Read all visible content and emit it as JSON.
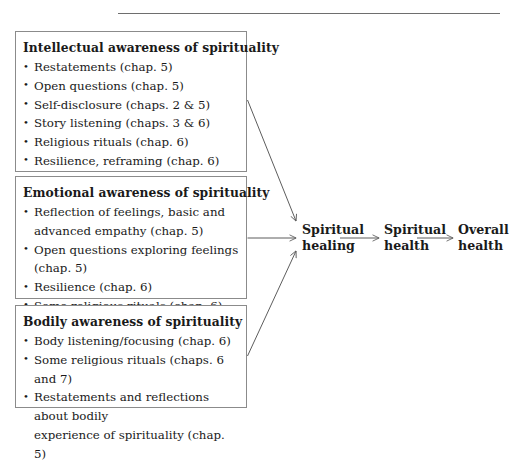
{
  "figure": {
    "top_rule": true,
    "background_color": "#ffffff",
    "line_color": "#5d5d5d",
    "box_border_color": "#8b8b8b",
    "text_color": "#1a1a1a"
  },
  "boxes": [
    {
      "id": "intellectual",
      "heading": "Intellectual awareness of spirituality",
      "items": [
        "Restatements (chap. 5)",
        "Open questions (chap. 5)",
        "Self-disclosure (chaps. 2 & 5)",
        "Story listening (chaps. 3 & 6)",
        "Religious rituals (chap. 6)",
        "Resilience, reframing (chap. 6)"
      ]
    },
    {
      "id": "emotional",
      "heading": "Emotional awareness of spirituality",
      "items": [
        "Reflection of feelings, basic and\nadvanced empathy (chap. 5)",
        "Open questions exploring feelings (chap. 5)",
        "Resilience (chap. 6)",
        "Some religious rituals (chap. 6)"
      ]
    },
    {
      "id": "bodily",
      "heading": "Bodily awareness of spirituality",
      "items": [
        "Body listening/focusing (chap. 6)",
        "Some religious rituals (chaps. 6 and 7)",
        "Restatements and reflections about bodily\nexperience of spirituality (chap. 5)"
      ]
    }
  ],
  "flow": {
    "nodes": [
      {
        "id": "spiritual-healing",
        "label": "Spiritual\nhealing"
      },
      {
        "id": "spiritual-health",
        "label": "Spiritual\nhealth"
      },
      {
        "id": "overall-health",
        "label": "Overall\nhealth"
      }
    ],
    "connectors": [
      {
        "from": "intellectual",
        "to": "spiritual-healing",
        "style": "diagonal-down-arrow"
      },
      {
        "from": "emotional",
        "to": "spiritual-healing",
        "style": "horizontal-arrow"
      },
      {
        "from": "bodily",
        "to": "spiritual-healing",
        "style": "diagonal-up-arrow"
      },
      {
        "from": "spiritual-healing",
        "to": "spiritual-health",
        "style": "horizontal-arrow"
      },
      {
        "from": "spiritual-health",
        "to": "overall-health",
        "style": "horizontal-arrow"
      }
    ]
  }
}
